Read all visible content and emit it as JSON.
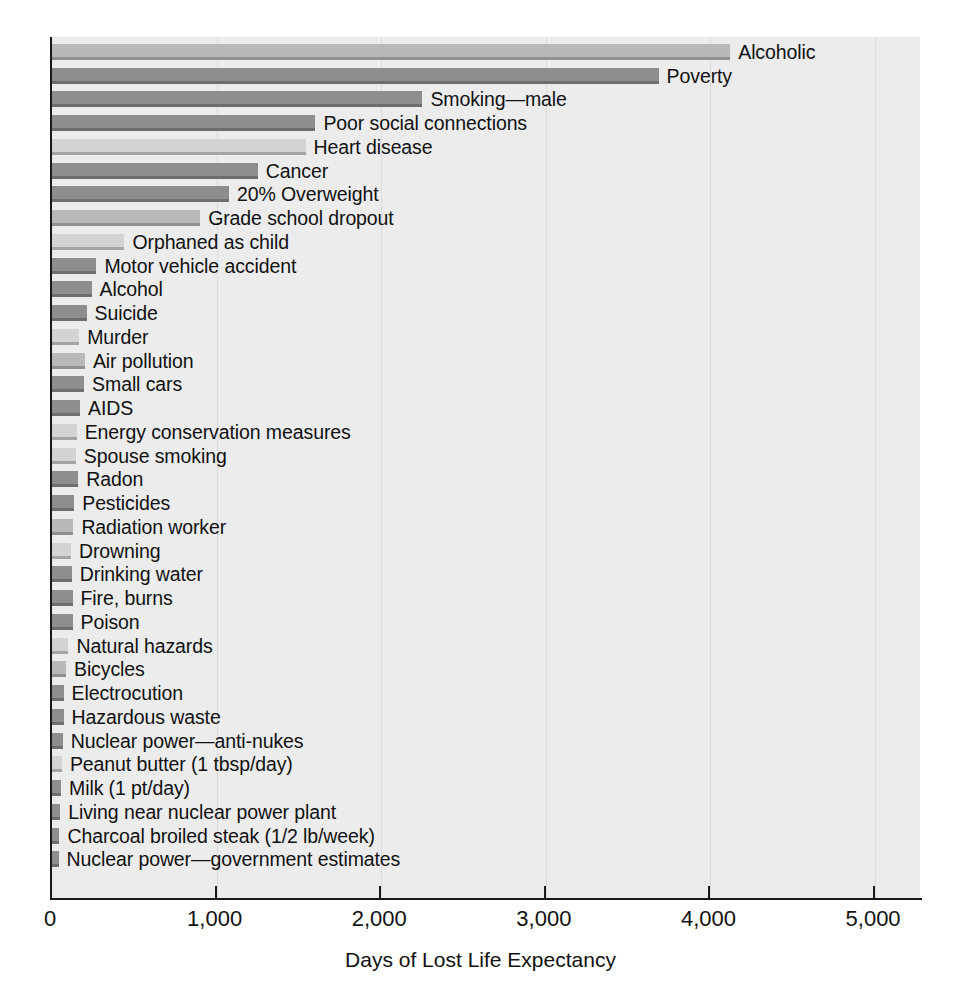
{
  "chart_data": {
    "type": "bar",
    "orientation": "horizontal",
    "title": "",
    "xlabel": "Days of Lost Life Expectancy",
    "ylabel": "",
    "xlim": [
      0,
      5285
    ],
    "xticks": [
      0,
      1000,
      2000,
      3000,
      4000,
      5000
    ],
    "xtick_labels": [
      "0",
      "1,000",
      "2,000",
      "3,000",
      "4,000",
      "5,000"
    ],
    "grid": "vertical-faint",
    "legend": "none",
    "categories": [
      "Alcoholic",
      "Poverty",
      "Smoking—male",
      "Poor social connections",
      "Heart disease",
      "Cancer",
      "20% Overweight",
      "Grade school dropout",
      "Orphaned as child",
      "Motor vehicle accident",
      "Alcohol",
      "Suicide",
      "Murder",
      "Air pollution",
      "Small cars",
      "AIDS",
      "Energy conservation measures",
      "Spouse smoking",
      "Radon",
      "Pesticides",
      "Radiation worker",
      "Drowning",
      "Drinking water",
      "Fire, burns",
      "Poison",
      "Natural hazards",
      "Bicycles",
      "Electrocution",
      "Hazardous waste",
      "Nuclear power—anti-nukes",
      "Peanut butter (1 tbsp/day)",
      "Milk (1 pt/day)",
      "Living near nuclear power plant",
      "Charcoal broiled steak (1/2 lb/week)",
      "Nuclear power—government estimates"
    ],
    "values": [
      4120,
      3685,
      2250,
      1600,
      1540,
      1250,
      1075,
      900,
      440,
      270,
      240,
      210,
      165,
      200,
      195,
      170,
      150,
      145,
      160,
      135,
      130,
      115,
      120,
      125,
      125,
      100,
      85,
      70,
      70,
      65,
      60,
      55,
      50,
      45,
      40
    ],
    "bar_shades": [
      "light",
      "dark",
      "dark",
      "dark",
      "pale",
      "dark",
      "dark",
      "light",
      "pale",
      "dark",
      "dark",
      "dark",
      "pale",
      "light",
      "dark",
      "dark",
      "pale",
      "pale",
      "dark",
      "dark",
      "light",
      "pale",
      "dark",
      "dark",
      "dark",
      "pale",
      "light",
      "dark",
      "dark",
      "dark",
      "pale",
      "dark",
      "dark",
      "dark",
      "dark"
    ],
    "colors": {
      "bar_light": "#b9b9b9",
      "bar_dark": "#8e8e8e",
      "bar_pale": "#d3d3d3",
      "plot_background": "#ececed",
      "axis": "#1a1a1a",
      "gridline": "#dcdcde",
      "text": "#111111"
    }
  }
}
